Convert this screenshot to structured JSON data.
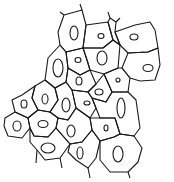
{
  "diagram": {
    "title": "",
    "stroke_color": "#1a1a1a",
    "background": "#ffffff",
    "cells": [
      {
        "id": "c1",
        "points": "64,15 82,10 86,25 83,48 66,52 60,45 58,32",
        "nucleus": {
          "cx": 74,
          "cy": 33,
          "rx": 4,
          "ry": 7
        }
      },
      {
        "id": "c2",
        "points": "86,25 108,22 113,40 103,48 83,48",
        "nucleus": {
          "cx": 101,
          "cy": 36,
          "rx": 3,
          "ry": 2.5
        }
      },
      {
        "id": "c3",
        "points": "115,32 135,25 150,22 155,30 158,48 148,52 128,53 120,45",
        "nucleus": {
          "cx": 134,
          "cy": 37,
          "rx": 4,
          "ry": 3
        }
      },
      {
        "id": "c4",
        "points": "108,22 110,18 116,22 115,32 120,45 113,40",
        "nucleus": null
      },
      {
        "id": "c5",
        "points": "83,48 103,48 113,40 120,45 118,68 104,74 90,70 87,60",
        "nucleus": {
          "cx": 102,
          "cy": 58,
          "rx": 5,
          "ry": 7
        }
      },
      {
        "id": "c6",
        "points": "66,52 83,48 87,60 90,70 80,75 68,68",
        "nucleus": {
          "cx": 78,
          "cy": 60,
          "rx": 3,
          "ry": 2.5
        }
      },
      {
        "id": "c7",
        "points": "128,53 148,52 158,48 160,65 155,80 140,81 130,78 122,68",
        "nucleus": {
          "cx": 148,
          "cy": 68,
          "rx": 5,
          "ry": 3.5
        }
      },
      {
        "id": "c8",
        "points": "118,68 122,68 130,78 128,92 112,92 104,74",
        "nucleus": {
          "cx": 118,
          "cy": 80,
          "rx": 2,
          "ry": 2
        }
      },
      {
        "id": "c9",
        "points": "60,45 66,52 68,68 66,82 55,88 45,80 48,58",
        "nucleus": {
          "cx": 58,
          "cy": 68,
          "rx": 5,
          "ry": 9
        }
      },
      {
        "id": "c10",
        "points": "68,68 80,75 90,70 96,84 88,92 72,90 66,82",
        "nucleus": {
          "cx": 79,
          "cy": 81,
          "rx": 3,
          "ry": 4
        }
      },
      {
        "id": "c11",
        "points": "96,84 104,74 112,92 106,102 92,98 88,92",
        "nucleus": {
          "cx": 99,
          "cy": 92,
          "rx": 4,
          "ry": 3
        }
      },
      {
        "id": "c12",
        "points": "45,80 55,88 58,100 50,112 38,110 32,98 35,86",
        "nucleus": {
          "cx": 45,
          "cy": 99,
          "rx": 3,
          "ry": 5
        }
      },
      {
        "id": "c13",
        "points": "22,95 35,86 32,98 38,110 28,118 15,112 12,100",
        "nucleus": {
          "cx": 24,
          "cy": 104,
          "rx": 3,
          "ry": 4
        }
      },
      {
        "id": "c14",
        "points": "55,88 66,82 72,90 76,108 68,120 58,118 50,112 58,100",
        "nucleus": {
          "cx": 66,
          "cy": 105,
          "rx": 4,
          "ry": 7
        }
      },
      {
        "id": "c15",
        "points": "72,90 88,92 92,98 96,108 90,118 76,108",
        "nucleus": {
          "cx": 87,
          "cy": 103,
          "rx": 3,
          "ry": 2
        }
      },
      {
        "id": "c16",
        "points": "92,98 106,102 112,92 128,92 136,100 140,128 134,136 120,134 115,118 100,118 96,108",
        "nucleus": {
          "cx": 121,
          "cy": 108,
          "rx": 4,
          "ry": 10
        }
      },
      {
        "id": "c17",
        "points": "5,118 15,112 28,118 30,128 22,138 8,136 4,126",
        "nucleus": {
          "cx": 17,
          "cy": 126,
          "rx": 4,
          "ry": 5
        }
      },
      {
        "id": "c18",
        "points": "28,118 38,110 50,112 58,118 56,128 48,137 34,136 30,128",
        "nucleus": {
          "cx": 43,
          "cy": 124,
          "rx": 5,
          "ry": 3.5
        }
      },
      {
        "id": "c19",
        "points": "58,118 68,120 76,108 90,118 92,130 82,142 70,144 56,128",
        "nucleus": {
          "cx": 71,
          "cy": 131,
          "rx": 4,
          "ry": 6
        }
      },
      {
        "id": "c20",
        "points": "90,118 100,118 115,118 120,134 114,137 100,141 92,130",
        "nucleus": {
          "cx": 106,
          "cy": 128,
          "rx": 2,
          "ry": 3
        }
      },
      {
        "id": "c21",
        "points": "30,128 34,136 48,137 56,128 70,144 60,158 45,160 37,150 30,142",
        "nucleus": {
          "cx": 48,
          "cy": 148,
          "rx": 7,
          "ry": 5
        }
      },
      {
        "id": "c22",
        "points": "70,144 82,142 92,130 100,141 96,158 88,168 76,160 68,152",
        "nucleus": {
          "cx": 80,
          "cy": 153,
          "rx": 3,
          "ry": 6
        }
      },
      {
        "id": "c23",
        "points": "100,141 114,137 120,134 134,136 142,148 138,162 128,172 110,172 100,160",
        "nucleus": {
          "cx": 118,
          "cy": 154,
          "rx": 5,
          "ry": 8
        }
      }
    ],
    "tails": [
      {
        "x1": 64,
        "y1": 15,
        "x2": 60,
        "y2": 12
      },
      {
        "x1": 82,
        "y1": 10,
        "x2": 80,
        "y2": 4
      },
      {
        "x1": 110,
        "y1": 18,
        "x2": 108,
        "y2": 12
      },
      {
        "x1": 116,
        "y1": 22,
        "x2": 120,
        "y2": 18
      },
      {
        "x1": 37,
        "y1": 150,
        "x2": 36,
        "y2": 163
      },
      {
        "x1": 60,
        "y1": 158,
        "x2": 62,
        "y2": 168
      },
      {
        "x1": 88,
        "y1": 168,
        "x2": 90,
        "y2": 178
      },
      {
        "x1": 128,
        "y1": 172,
        "x2": 130,
        "y2": 178
      }
    ]
  }
}
